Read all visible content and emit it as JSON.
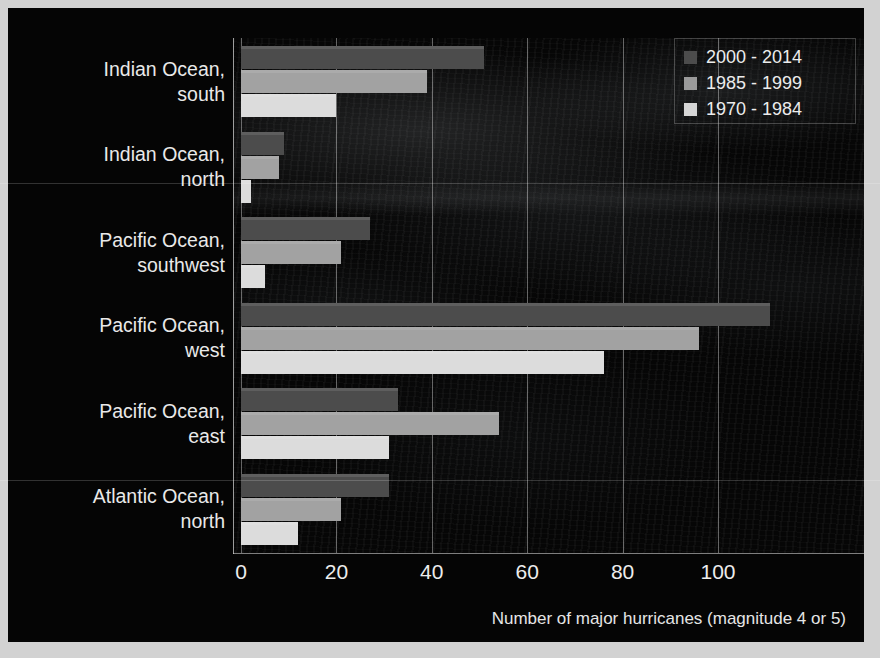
{
  "chart_data": {
    "type": "bar",
    "orientation": "horizontal",
    "title": "",
    "xlabel": "Number of major hurricanes (magnitude 4 or 5)",
    "ylabel": "",
    "xlim": [
      0,
      115
    ],
    "xticks": [
      0,
      20,
      40,
      60,
      80,
      100
    ],
    "grid": true,
    "legend_position": "top-right",
    "categories": [
      "Indian Ocean, south",
      "Indian Ocean, north",
      "Pacific Ocean, southwest",
      "Pacific Ocean, west",
      "Pacific Ocean, east",
      "Atlantic Ocean, north"
    ],
    "series": [
      {
        "name": "2000 - 2014",
        "color": "#4c4c4c",
        "values": [
          51,
          9,
          27,
          111,
          33,
          31
        ]
      },
      {
        "name": "1985 - 1999",
        "color": "#a2a2a2",
        "values": [
          39,
          8,
          21,
          96,
          54,
          21
        ]
      },
      {
        "name": "1970 - 1984",
        "color": "#dcdcdc",
        "values": [
          20,
          2,
          5,
          76,
          31,
          12
        ]
      }
    ]
  },
  "legend": {
    "entries": [
      {
        "label": "2000 - 2014"
      },
      {
        "label": "1985 - 1999"
      },
      {
        "label": "1970 - 1984"
      }
    ]
  },
  "axis": {
    "x_title": "Number of major hurricanes (magnitude 4 or 5)",
    "ticks": [
      "0",
      "20",
      "40",
      "60",
      "80",
      "100"
    ]
  },
  "categories": [
    {
      "line1": "Indian Ocean,",
      "line2": "south"
    },
    {
      "line1": "Indian Ocean,",
      "line2": "north"
    },
    {
      "line1": "Pacific Ocean,",
      "line2": "southwest"
    },
    {
      "line1": "Pacific Ocean,",
      "line2": "west"
    },
    {
      "line1": "Pacific Ocean,",
      "line2": "east"
    },
    {
      "line1": "Atlantic Ocean,",
      "line2": "north"
    }
  ],
  "colors": {
    "background": "#050505",
    "frame": "#d2d2d2",
    "text": "#ececec",
    "series_2000_2014": "#4c4c4c",
    "series_1985_1999": "#a2a2a2",
    "series_1970_1984": "#dcdcdc"
  }
}
